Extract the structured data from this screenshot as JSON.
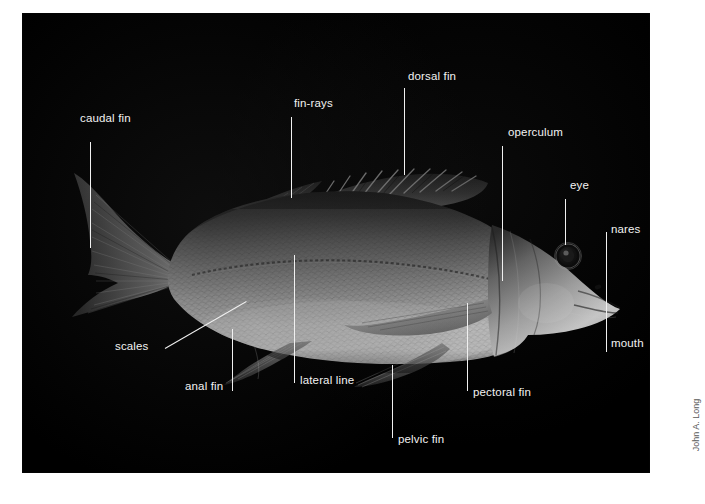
{
  "figure": {
    "background_color": "#ffffff",
    "plate_color": "#000000",
    "label_color": "#f2f2f2",
    "leader_color": "#f0f0f0",
    "credit": "John A. Long",
    "credit_color": "#595959"
  },
  "labels": {
    "caudal_fin": "caudal fin",
    "fin_rays": "fin-rays",
    "dorsal_fin": "dorsal fin",
    "operculum": "operculum",
    "eye": "eye",
    "nares": "nares",
    "mouth": "mouth",
    "scales": "scales",
    "anal_fin": "anal fin",
    "lateral_line": "lateral line",
    "pelvic_fin": "pelvic fin",
    "pectoral_fin": "pectoral fin"
  },
  "bleed": {
    "text": " "
  }
}
